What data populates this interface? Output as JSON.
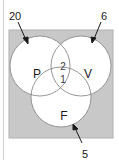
{
  "diagram": {
    "type": "venn",
    "sets": [
      {
        "id": "P",
        "label": "P"
      },
      {
        "id": "V",
        "label": "V"
      },
      {
        "id": "F",
        "label": "F"
      }
    ],
    "region_values": {
      "P_and_V_only": "2",
      "P_and_V_and_F": "1"
    },
    "callouts": {
      "outside_top_left": "20",
      "outside_top_right": "6",
      "outside_bottom": "5"
    },
    "colors": {
      "universe_fill": "#c8c8c8",
      "circle_fill": "#ffffff",
      "circle_stroke": "#8a8a8a",
      "text": "#1a1a1a"
    }
  }
}
